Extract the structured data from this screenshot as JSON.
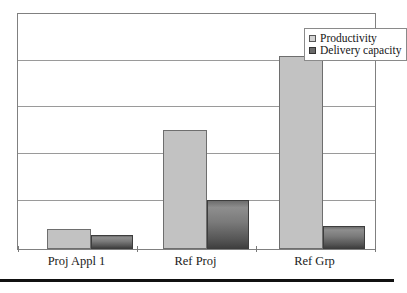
{
  "chart_data": {
    "type": "bar",
    "title": "",
    "subtitle": "",
    "xlabel": "",
    "ylabel": "",
    "categories": [
      "Proj Appl 1",
      "Ref Proj",
      "Ref Grp"
    ],
    "series": [
      {
        "name": "Productivity",
        "values": [
          0.42,
          2.53,
          4.11
        ],
        "color": "#c2c2c2"
      },
      {
        "name": "Delivery capacity",
        "values": [
          0.3,
          1.05,
          0.49
        ],
        "color": "#6d6d6d"
      }
    ],
    "ylim": [
      0,
      5
    ],
    "yticks": [
      0,
      1,
      2,
      3,
      4,
      5
    ],
    "ytick_labels": [],
    "grid": true,
    "grid_axis": "y",
    "legend_position": "top-right",
    "axis_labels_visible": false
  },
  "legend": {
    "entries": [
      {
        "label": "Productivity",
        "swatch": "light-gray-square"
      },
      {
        "label": "Delivery capacity",
        "swatch": "dark-gray-square"
      }
    ]
  },
  "axis": {
    "categories": [
      "Proj Appl 1",
      "Ref Proj",
      "Ref Grp"
    ]
  }
}
